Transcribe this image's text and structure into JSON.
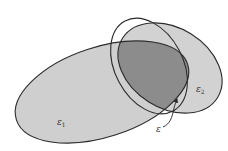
{
  "diagram": {
    "type": "ellipsoid-intersection",
    "labels": {
      "e1": "ε",
      "e1_sub": "1",
      "e2": "ε",
      "e2_sub": "2",
      "e": "ε"
    },
    "colors": {
      "background": "#ffffff",
      "ellipse_fill": "#cfcfcf",
      "intersection_fill": "#8a8a8a",
      "stroke": "#2a2a2a"
    },
    "elements": [
      {
        "name": "ellipse-e1",
        "label": "ε1",
        "description": "large ellipsoid"
      },
      {
        "name": "ellipse-e2",
        "label": "ε2",
        "description": "second ellipsoid"
      },
      {
        "name": "ellipse-e",
        "label": "ε",
        "description": "ellipsoid containing the intersection of ε1 and ε2"
      }
    ]
  }
}
